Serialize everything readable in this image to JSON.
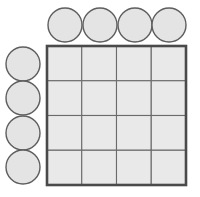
{
  "figure": {
    "background_color": "#ffffff",
    "width": 200,
    "height": 197
  },
  "grid": {
    "name": "square-grid",
    "rows": 4,
    "columns": 4,
    "total_cells": 16,
    "origin_x": 47,
    "origin_y": 46,
    "cell_size": 34.75,
    "cell_fill_color": "#e9e9e9",
    "cell_stroke_color": "#6b6b6b",
    "outline_stroke_color": "#4a4a4a",
    "outline_stroke_width": 2.6,
    "cell_stroke_width": 1.1,
    "cells": [
      {
        "row": 0,
        "col": 0,
        "label": ""
      },
      {
        "row": 0,
        "col": 1,
        "label": ""
      },
      {
        "row": 0,
        "col": 2,
        "label": ""
      },
      {
        "row": 0,
        "col": 3,
        "label": ""
      },
      {
        "row": 1,
        "col": 0,
        "label": ""
      },
      {
        "row": 1,
        "col": 1,
        "label": ""
      },
      {
        "row": 1,
        "col": 2,
        "label": ""
      },
      {
        "row": 1,
        "col": 3,
        "label": ""
      },
      {
        "row": 2,
        "col": 0,
        "label": ""
      },
      {
        "row": 2,
        "col": 1,
        "label": ""
      },
      {
        "row": 2,
        "col": 2,
        "label": ""
      },
      {
        "row": 2,
        "col": 3,
        "label": ""
      },
      {
        "row": 3,
        "col": 0,
        "label": ""
      },
      {
        "row": 3,
        "col": 1,
        "label": ""
      },
      {
        "row": 3,
        "col": 2,
        "label": ""
      },
      {
        "row": 3,
        "col": 3,
        "label": ""
      }
    ]
  },
  "column_markers": {
    "name": "top-circle-row",
    "count": 4,
    "radius": 17,
    "center_y": 25,
    "fill_color": "#e4e4e4",
    "stroke_color": "#5e5e5e",
    "circles": [
      {
        "index": 0,
        "cx": 65,
        "cy": 25,
        "label": ""
      },
      {
        "index": 1,
        "cx": 100,
        "cy": 25,
        "label": ""
      },
      {
        "index": 2,
        "cx": 135,
        "cy": 25,
        "label": ""
      },
      {
        "index": 3,
        "cx": 169,
        "cy": 25,
        "label": ""
      }
    ]
  },
  "row_markers": {
    "name": "left-circle-column",
    "count": 4,
    "radius": 17,
    "center_x": 23,
    "fill_color": "#e4e4e4",
    "stroke_color": "#5e5e5e",
    "circles": [
      {
        "index": 0,
        "cx": 23,
        "cy": 64,
        "label": ""
      },
      {
        "index": 1,
        "cx": 23,
        "cy": 98,
        "label": ""
      },
      {
        "index": 2,
        "cx": 23,
        "cy": 133,
        "label": ""
      },
      {
        "index": 3,
        "cx": 23,
        "cy": 167,
        "label": ""
      }
    ]
  }
}
